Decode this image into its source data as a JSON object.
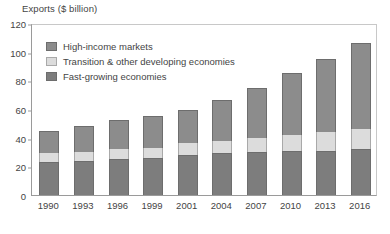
{
  "chart_data": {
    "type": "bar",
    "subtype": "stacked-column",
    "title": "Exports ($ billion)",
    "xlabel": "",
    "ylabel": "Exports ($ billion)",
    "ylim": [
      0,
      120
    ],
    "yticks": [
      0,
      20,
      40,
      60,
      80,
      100,
      120
    ],
    "grid": false,
    "legend_position": "upper-left-inside",
    "categories": [
      "1990",
      "1993",
      "1996",
      "1999",
      "2001",
      "2004",
      "2007",
      "2010",
      "2013",
      "2016"
    ],
    "series": [
      {
        "name": "Fast-growing economies",
        "color": "#7d7d7d",
        "values": [
          23,
          24,
          25,
          26,
          28,
          29,
          30,
          31,
          31,
          32
        ]
      },
      {
        "name": "Transition & other developing economies",
        "color": "#dcdcdc",
        "values": [
          6,
          6,
          7,
          7,
          8,
          9,
          10,
          11,
          13,
          14
        ]
      },
      {
        "name": "High-income markets",
        "color": "#8c8c8c",
        "values": [
          16,
          18,
          20,
          22,
          23,
          28,
          35,
          43,
          51,
          60
        ]
      }
    ],
    "totals": [
      45,
      48,
      52,
      55,
      59,
      66,
      75,
      85,
      95,
      106
    ]
  },
  "legend": {
    "items": [
      {
        "label": "High-income markets",
        "swatch": "high-income-swatch"
      },
      {
        "label": "Transition & other developing economies",
        "swatch": "transition-swatch"
      },
      {
        "label": "Fast-growing economies",
        "swatch": "fast-growing-swatch"
      }
    ]
  }
}
